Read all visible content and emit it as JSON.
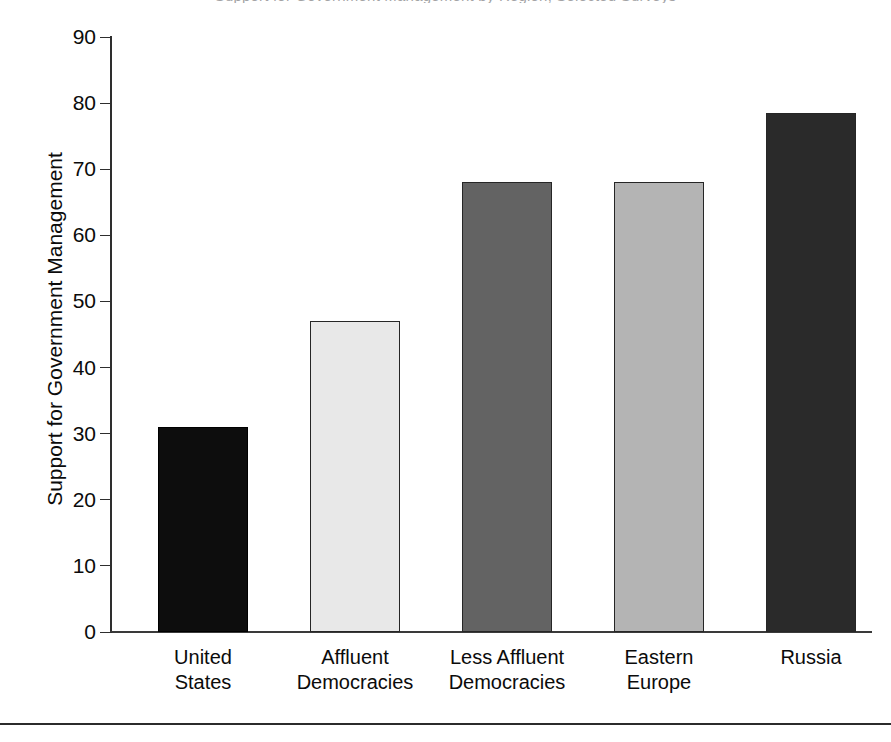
{
  "caption_sliver": "Support for Government Management by Region, Selected Surveys",
  "bottom_rule": "horizontal-rule",
  "chart_data": {
    "type": "bar",
    "title": "",
    "xlabel": "",
    "ylabel": "Support for Government Management",
    "ylim": [
      0,
      90
    ],
    "ytick_step": 10,
    "yticks": [
      "90",
      "80",
      "70",
      "60",
      "50",
      "40",
      "30",
      "20",
      "10",
      "0"
    ],
    "grid": false,
    "legend": "none",
    "categories": [
      "United\nStates",
      "Affluent\nDemocracies",
      "Less Affluent\nDemocracies",
      "Eastern\nEurope",
      "Russia"
    ],
    "category_lines": [
      [
        "United",
        "States"
      ],
      [
        "Affluent",
        "Democracies"
      ],
      [
        "Less Affluent",
        "Democracies"
      ],
      [
        "Eastern",
        "Europe"
      ],
      [
        "Russia",
        ""
      ]
    ],
    "values": [
      31,
      47,
      68,
      68,
      78.5
    ],
    "bar_colors": [
      "#0d0d0d",
      "#e8e8e8",
      "#636363",
      "#b4b4b4",
      "#2a2a2a"
    ],
    "bar_edge_color": "#262626"
  },
  "axis": {
    "line_color": "#2e2e2e",
    "baseline_color": "#3a3a3a"
  }
}
